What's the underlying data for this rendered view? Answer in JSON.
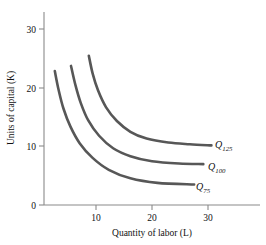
{
  "chart_data": {
    "type": "line",
    "title": "",
    "xlabel": "Quantity of labor (L)",
    "ylabel": "Units of capital (K)",
    "xlim": [
      0,
      40
    ],
    "ylim": [
      0,
      34
    ],
    "xticks": [
      "10",
      "20",
      "30"
    ],
    "xtick_values": [
      10,
      20,
      30
    ],
    "yticks": [
      "0",
      "10",
      "20",
      "30"
    ],
    "ytick_values": [
      0,
      10,
      20,
      30
    ],
    "grid": false,
    "legend_position": "inline-right-of-curve",
    "curve_color": "#575757",
    "axis_color": "#8a8a8a",
    "series": [
      {
        "name": "Q_125",
        "label_main": "Q",
        "label_sub": "125",
        "output": 125,
        "points": [
          {
            "L": 8.3,
            "K": 26.3
          },
          {
            "L": 9.0,
            "K": 23.2
          },
          {
            "L": 10.0,
            "K": 20.2
          },
          {
            "L": 11.5,
            "K": 17.2
          },
          {
            "L": 13.5,
            "K": 14.8
          },
          {
            "L": 16.0,
            "K": 12.9
          },
          {
            "L": 19.0,
            "K": 11.7
          },
          {
            "L": 23.0,
            "K": 11.0
          },
          {
            "L": 27.0,
            "K": 10.7
          },
          {
            "L": 31.0,
            "K": 10.5
          }
        ]
      },
      {
        "name": "Q_100",
        "label_main": "Q",
        "label_sub": "100",
        "output": 100,
        "points": [
          {
            "L": 5.0,
            "K": 24.5
          },
          {
            "L": 5.8,
            "K": 21.2
          },
          {
            "L": 6.8,
            "K": 18.0
          },
          {
            "L": 8.2,
            "K": 14.9
          },
          {
            "L": 10.2,
            "K": 12.2
          },
          {
            "L": 12.8,
            "K": 10.0
          },
          {
            "L": 16.0,
            "K": 8.6
          },
          {
            "L": 20.0,
            "K": 7.7
          },
          {
            "L": 25.0,
            "K": 7.3
          },
          {
            "L": 29.5,
            "K": 7.2
          }
        ]
      },
      {
        "name": "Q_75",
        "label_main": "Q",
        "label_sub": "75",
        "output": 75,
        "points": [
          {
            "L": 2.0,
            "K": 23.6
          },
          {
            "L": 2.7,
            "K": 20.3
          },
          {
            "L": 3.6,
            "K": 17.0
          },
          {
            "L": 4.9,
            "K": 13.8
          },
          {
            "L": 6.6,
            "K": 10.9
          },
          {
            "L": 9.0,
            "K": 8.3
          },
          {
            "L": 12.0,
            "K": 6.2
          },
          {
            "L": 16.0,
            "K": 4.7
          },
          {
            "L": 21.0,
            "K": 3.9
          },
          {
            "L": 27.8,
            "K": 3.6
          }
        ]
      }
    ]
  }
}
